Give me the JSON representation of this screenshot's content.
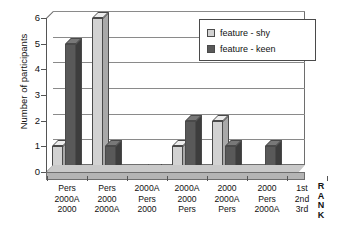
{
  "chart_data": {
    "type": "bar",
    "title": "",
    "xlabel": "",
    "ylabel": "Number of participants",
    "ylim": [
      0,
      6
    ],
    "yticks": [
      0,
      1,
      2,
      3,
      4,
      5,
      6
    ],
    "grid": true,
    "legend_position": "top-right",
    "categories": [
      "Pers 2000A 2000",
      "Pers 2000 2000A",
      "2000A Pers 2000",
      "2000A 2000 Pers",
      "2000 2000A Pers",
      "2000 Pers 2000A"
    ],
    "category_lines": [
      [
        "Pers",
        "2000A",
        "2000"
      ],
      [
        "Pers",
        "2000",
        "2000A"
      ],
      [
        "2000A",
        "Pers",
        "2000"
      ],
      [
        "2000A",
        "2000",
        "Pers"
      ],
      [
        "2000",
        "2000A",
        "Pers"
      ],
      [
        "2000",
        "Pers",
        "2000A"
      ]
    ],
    "series": [
      {
        "name": "feature - shy",
        "values": [
          1,
          6,
          0,
          1,
          2,
          0
        ],
        "color": "#d2d2d2"
      },
      {
        "name": "feature - keen",
        "values": [
          5,
          1,
          0,
          2,
          1,
          1
        ],
        "color": "#595959"
      }
    ],
    "rank_column": {
      "values": [
        "1st",
        "2nd",
        "3rd"
      ],
      "label": "RANK",
      "label_letters": [
        "R",
        "A",
        "N",
        "K"
      ]
    }
  },
  "legend": {
    "items": [
      {
        "label": "feature - shy"
      },
      {
        "label": "feature - keen"
      }
    ]
  }
}
